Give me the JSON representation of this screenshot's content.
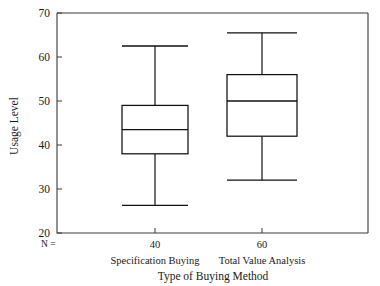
{
  "chart_data": {
    "type": "boxplot",
    "title": "",
    "xlabel": "Type of Buying Method",
    "ylabel": "Usage Level",
    "ylim": [
      20,
      70
    ],
    "yticks": [
      20,
      30,
      40,
      50,
      60,
      70
    ],
    "ytick_labels": [
      "20",
      "30",
      "40",
      "50",
      "60",
      "70"
    ],
    "grid": false,
    "legend": null,
    "n_row_label": "N =",
    "categories": [
      "Specification Buying",
      "Total Value Analysis"
    ],
    "n_values": [
      "40",
      "60"
    ],
    "boxes": [
      {
        "category": "Specification Buying",
        "n": "40",
        "whisker_low": 26.3,
        "q1": 38.0,
        "median": 43.5,
        "q3": 49.0,
        "whisker_high": 62.5
      },
      {
        "category": "Total Value Analysis",
        "n": "60",
        "whisker_low": 32.0,
        "q1": 42.0,
        "median": 50.0,
        "q3": 56.0,
        "whisker_high": 65.5
      }
    ],
    "colors": {
      "box_fill": "#ffffff",
      "box_stroke": "#111111",
      "axis": "#3a3a3a",
      "text": "#1a1a1a",
      "background": "#ffffff"
    }
  }
}
